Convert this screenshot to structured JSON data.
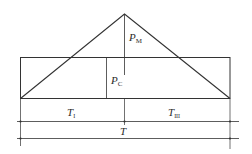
{
  "diagram": {
    "type": "trapezoidal-triangular load profile",
    "colors": {
      "background": "#ffffff",
      "stroke": "#333333",
      "text": "#2a2a2a"
    },
    "labels": {
      "pm": {
        "main": "P",
        "sub": "M"
      },
      "pc": {
        "main": "P",
        "sub": "C"
      },
      "t1": {
        "main": "T",
        "sub": "I"
      },
      "t3": {
        "main": "T",
        "sub": "III"
      },
      "t": {
        "main": "T",
        "sub": ""
      }
    }
  }
}
